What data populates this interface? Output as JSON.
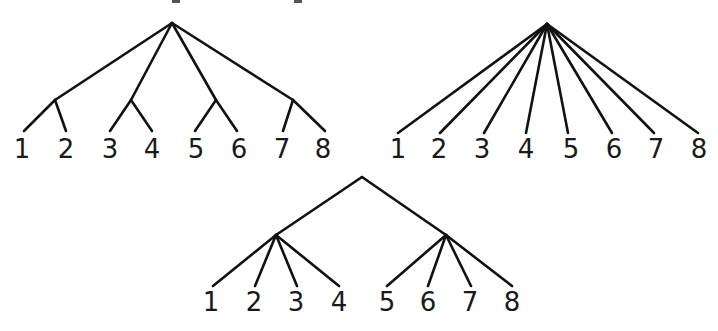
{
  "canvas": {
    "width": 718,
    "height": 331,
    "background": "#ffffff",
    "stroke_color": "#111111",
    "label_color": "#1a1a1a"
  },
  "top_cropped_text_fragments": [
    {
      "x": 172,
      "y": 0,
      "w": 8,
      "h": 3
    },
    {
      "x": 294,
      "y": 0,
      "w": 8,
      "h": 3
    }
  ],
  "trees": [
    {
      "id": "tree-grouped-pairs",
      "description": "Root with four children, each splitting into two leaves",
      "nodes": {
        "root": [
          172,
          23
        ],
        "a": [
          55,
          100
        ],
        "b": [
          131,
          100
        ],
        "c": [
          216,
          100
        ],
        "d": [
          293,
          100
        ]
      },
      "edges": [
        [
          "root",
          "a"
        ],
        [
          "root",
          "b"
        ],
        [
          "root",
          "c"
        ],
        [
          "root",
          "d"
        ]
      ],
      "leaf_edges": [
        {
          "from": "a",
          "to": [
            24,
            131
          ]
        },
        {
          "from": "a",
          "to": [
            66,
            131
          ]
        },
        {
          "from": "b",
          "to": [
            110,
            131
          ]
        },
        {
          "from": "b",
          "to": [
            152,
            131
          ]
        },
        {
          "from": "c",
          "to": [
            195,
            131
          ]
        },
        {
          "from": "c",
          "to": [
            237,
            131
          ]
        },
        {
          "from": "d",
          "to": [
            283,
            131
          ]
        },
        {
          "from": "d",
          "to": [
            325,
            131
          ]
        }
      ],
      "labels": [
        {
          "text": "1",
          "x": 22,
          "y": 158
        },
        {
          "text": "2",
          "x": 66,
          "y": 158
        },
        {
          "text": "3",
          "x": 110,
          "y": 158
        },
        {
          "text": "4",
          "x": 152,
          "y": 158
        },
        {
          "text": "5",
          "x": 196,
          "y": 158
        },
        {
          "text": "6",
          "x": 239,
          "y": 158
        },
        {
          "text": "7",
          "x": 282,
          "y": 158
        },
        {
          "text": "8",
          "x": 323,
          "y": 158
        }
      ]
    },
    {
      "id": "tree-flat",
      "description": "Root directly connected to eight leaves",
      "nodes": {
        "root": [
          547,
          24
        ]
      },
      "edges": [],
      "leaf_edges": [
        {
          "from": "root",
          "to": [
            398,
            133
          ]
        },
        {
          "from": "root",
          "to": [
            440,
            133
          ]
        },
        {
          "from": "root",
          "to": [
            484,
            133
          ]
        },
        {
          "from": "root",
          "to": [
            526,
            133
          ]
        },
        {
          "from": "root",
          "to": [
            568,
            133
          ]
        },
        {
          "from": "root",
          "to": [
            612,
            133
          ]
        },
        {
          "from": "root",
          "to": [
            654,
            133
          ]
        },
        {
          "from": "root",
          "to": [
            698,
            133
          ]
        }
      ],
      "labels": [
        {
          "text": "1",
          "x": 398,
          "y": 158
        },
        {
          "text": "2",
          "x": 439,
          "y": 158
        },
        {
          "text": "3",
          "x": 482,
          "y": 158
        },
        {
          "text": "4",
          "x": 526,
          "y": 158
        },
        {
          "text": "5",
          "x": 571,
          "y": 158
        },
        {
          "text": "6",
          "x": 614,
          "y": 158
        },
        {
          "text": "7",
          "x": 656,
          "y": 158
        },
        {
          "text": "8",
          "x": 699,
          "y": 158
        }
      ]
    },
    {
      "id": "tree-grouped-quads",
      "description": "Root with two children, each splitting into four leaves",
      "nodes": {
        "root": [
          362,
          177
        ],
        "a": [
          276,
          235
        ],
        "b": [
          446,
          235
        ]
      },
      "edges": [
        [
          "root",
          "a"
        ],
        [
          "root",
          "b"
        ]
      ],
      "leaf_edges": [
        {
          "from": "a",
          "to": [
            213,
            286
          ]
        },
        {
          "from": "a",
          "to": [
            255,
            286
          ]
        },
        {
          "from": "a",
          "to": [
            297,
            286
          ]
        },
        {
          "from": "a",
          "to": [
            339,
            286
          ]
        },
        {
          "from": "b",
          "to": [
            387,
            286
          ]
        },
        {
          "from": "b",
          "to": [
            428,
            286
          ]
        },
        {
          "from": "b",
          "to": [
            471,
            286
          ]
        },
        {
          "from": "b",
          "to": [
            512,
            286
          ]
        }
      ],
      "labels": [
        {
          "text": "1",
          "x": 211,
          "y": 311
        },
        {
          "text": "2",
          "x": 254,
          "y": 311
        },
        {
          "text": "3",
          "x": 296,
          "y": 311
        },
        {
          "text": "4",
          "x": 339,
          "y": 311
        },
        {
          "text": "5",
          "x": 387,
          "y": 311
        },
        {
          "text": "6",
          "x": 428,
          "y": 311
        },
        {
          "text": "7",
          "x": 470,
          "y": 311
        },
        {
          "text": "8",
          "x": 512,
          "y": 311
        }
      ]
    }
  ]
}
